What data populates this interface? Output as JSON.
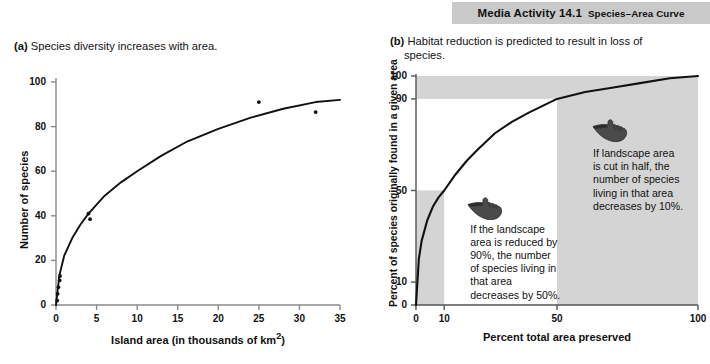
{
  "banner": {
    "title": "Media Activity 14.1",
    "subtitle": "Species–Area Curve"
  },
  "panel_a": {
    "label": "(a)",
    "caption": "Species diversity increases with area."
  },
  "panel_b": {
    "label": "(b)",
    "caption_line1": "Habitat reduction is predicted to result in loss of",
    "caption_line2": "species.",
    "annotation_left": "If the landscape\narea is reduced by\n90%, the number\nof species living in\nthat area\ndecreases by 50%.",
    "annotation_right": "If landscape area\nis cut in half, the\nnumber of species\nliving in that area\ndecreases by 10%.",
    "icon_left": "pointing-hand-icon",
    "icon_right": "pointing-hand-icon",
    "shade_color": "#d4d4d4"
  },
  "chart_data": [
    {
      "type": "scatter",
      "panel": "a",
      "title": "Species diversity increases with area.",
      "xlabel": "Island area (in thousands of km²)",
      "ylabel": "Number of species",
      "xlim": [
        0,
        35
      ],
      "ylim": [
        0,
        100
      ],
      "xticks": [
        0,
        5,
        10,
        15,
        20,
        25,
        30,
        35
      ],
      "yticks": [
        0,
        20,
        40,
        60,
        80,
        100
      ],
      "grid": false,
      "legend": "none",
      "points": [
        {
          "x": 0.15,
          "y": 2
        },
        {
          "x": 0.2,
          "y": 5
        },
        {
          "x": 0.3,
          "y": 8
        },
        {
          "x": 0.45,
          "y": 11
        },
        {
          "x": 0.5,
          "y": 13
        },
        {
          "x": 4.0,
          "y": 41
        },
        {
          "x": 4.2,
          "y": 38.5
        },
        {
          "x": 25.0,
          "y": 91
        },
        {
          "x": 32.0,
          "y": 86.5
        }
      ],
      "fit_curve": {
        "description": "saturating power-law species-area curve S = 30.5 * A^0.315",
        "x": [
          0,
          0.4,
          1,
          2,
          3,
          4,
          6,
          8,
          10,
          13,
          16,
          20,
          24,
          28,
          32,
          35
        ],
        "y": [
          0,
          13,
          22,
          30,
          36,
          41,
          49,
          55,
          60,
          67,
          73,
          79,
          84,
          88,
          91,
          92
        ]
      }
    },
    {
      "type": "line",
      "panel": "b",
      "title": "Habitat reduction is predicted to result in loss of species.",
      "xlabel": "Percent total area preserved",
      "ylabel": "Percent of species originally found in a given area",
      "xlim": [
        0,
        100
      ],
      "ylim": [
        0,
        100
      ],
      "xticks": [
        0,
        10,
        50,
        100
      ],
      "yticks": [
        0,
        10,
        50,
        90,
        100
      ],
      "grid": false,
      "legend": "none",
      "curve": {
        "description": "species retained vs area preserved; 10% area -> 50% species, 50% area -> 90% species",
        "x": [
          0,
          1,
          2,
          4,
          6,
          8,
          10,
          14,
          18,
          22,
          28,
          34,
          40,
          50,
          60,
          70,
          80,
          90,
          100
        ],
        "y": [
          0,
          20,
          28,
          37,
          43,
          47,
          50,
          57,
          63,
          68,
          75,
          80,
          84,
          90,
          93,
          95,
          97,
          99,
          100
        ]
      },
      "annotations": [
        {
          "at_x": 10,
          "at_y": 50,
          "text": "If the landscape area is reduced by 90%, the number of species living in that area decreases by 50%."
        },
        {
          "at_x": 50,
          "at_y": 90,
          "text": "If landscape area is cut in half, the number of species living in that area decreases by 10%."
        }
      ],
      "shaded_regions": [
        {
          "name": "top-band",
          "x": [
            0,
            100
          ],
          "y": [
            90,
            100
          ]
        },
        {
          "name": "right-block",
          "x": [
            50,
            100
          ],
          "y": [
            0,
            100
          ]
        },
        {
          "name": "lower-left-block",
          "x": [
            0,
            10
          ],
          "y": [
            0,
            50
          ]
        }
      ]
    }
  ]
}
